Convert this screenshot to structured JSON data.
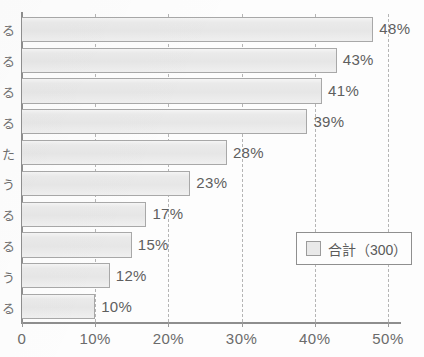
{
  "chart_data": {
    "type": "bar",
    "orientation": "horizontal",
    "title": "",
    "subtitle": "",
    "xlabel": "",
    "ylabel": "",
    "xlim": [
      0,
      50
    ],
    "grid": true,
    "legend_position": "inside-right-lower",
    "categories": [
      "る",
      "る",
      "る",
      "る",
      "た",
      "う",
      "る",
      "る",
      "う",
      "る"
    ],
    "values": [
      48,
      43,
      41,
      39,
      28,
      23,
      17,
      15,
      12,
      10
    ],
    "value_labels": [
      "48%",
      "43%",
      "41%",
      "39%",
      "28%",
      "23%",
      "17%",
      "15%",
      "12%",
      "10%"
    ],
    "x_ticks": [
      0,
      10,
      20,
      30,
      40,
      50
    ],
    "x_tick_labels": [
      "0",
      "10%",
      "20%",
      "30%",
      "40%",
      "50%"
    ],
    "series": [
      {
        "name": "合計（300）",
        "values": [
          48,
          43,
          41,
          39,
          28,
          23,
          17,
          15,
          12,
          10
        ]
      }
    ],
    "colors": {
      "bar_fill": "#e9e9e9",
      "bar_border": "#a8a8a8",
      "axis": "#8e8e8e",
      "gridline": "#b5b5b5",
      "text": "#5f5f5f",
      "background": "#fdfdfd"
    }
  },
  "legend": {
    "swatch_name": "total-series-swatch",
    "label": "合計（300）"
  }
}
